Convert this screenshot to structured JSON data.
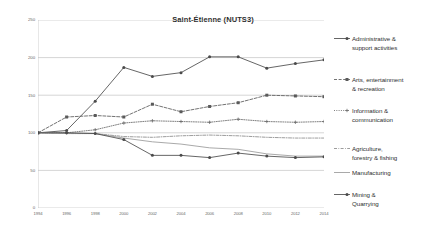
{
  "chart": {
    "title": "Saint-Étienne (NUTS3)"
  },
  "axes": {
    "y_tick_labels": [
      "250",
      "200",
      "150",
      "100",
      "50",
      "0"
    ],
    "x_tick_labels": [
      "1994",
      "1996",
      "1998",
      "2000",
      "2002",
      "2004",
      "2006",
      "2008",
      "2010",
      "2012",
      "2014"
    ]
  },
  "legend": {
    "items": [
      {
        "label": "Administrative &\nsupport activities",
        "color": "#4a4a4a",
        "dash": "solid",
        "marker": "circle"
      },
      {
        "label": "Arts, entertainment\n& recreation",
        "color": "#5a5a5a",
        "dash": "dashed",
        "marker": "square"
      },
      {
        "label": "Information &\ncommunication",
        "color": "#6a6a6a",
        "dash": "dotted",
        "marker": "plus"
      },
      {
        "label": "Agriculture,\nforestry & fishing",
        "color": "#8a8a8a",
        "dash": "dashdot",
        "marker": "none"
      },
      {
        "label": "Manufacturing",
        "color": "#9a9a9a",
        "dash": "solid",
        "marker": "none"
      },
      {
        "label": "Mining &\nQuarrying",
        "color": "#4a4a4a",
        "dash": "solid",
        "marker": "circle"
      }
    ]
  },
  "chart_data": {
    "type": "line",
    "title": "Saint-Étienne (NUTS3)",
    "xlabel": "",
    "ylabel": "",
    "x": [
      1994,
      1996,
      1998,
      2000,
      2002,
      2004,
      2006,
      2008,
      2010,
      2012,
      2014
    ],
    "xlim": [
      1994,
      2014
    ],
    "ylim": [
      0,
      250
    ],
    "yticks": [
      0,
      50,
      100,
      150,
      200,
      250
    ],
    "grid": true,
    "legend_position": "right",
    "series": [
      {
        "name": "Administrative & support activities",
        "color": "#4a4a4a",
        "dash": "solid",
        "marker": "circle",
        "values": [
          100,
          103,
          142,
          187,
          175,
          180,
          201,
          201,
          186,
          192,
          197
        ]
      },
      {
        "name": "Arts, entertainment & recreation",
        "color": "#5a5a5a",
        "dash": "dashed",
        "marker": "square",
        "values": [
          100,
          121,
          123,
          121,
          138,
          128,
          135,
          140,
          150,
          149,
          148
        ]
      },
      {
        "name": "Information & communication",
        "color": "#6a6a6a",
        "dash": "dotted",
        "marker": "plus",
        "values": [
          100,
          100,
          104,
          113,
          116,
          115,
          114,
          118,
          115,
          114,
          115
        ]
      },
      {
        "name": "Agriculture, forestry & fishing",
        "color": "#8a8a8a",
        "dash": "dashdot",
        "marker": "none",
        "values": [
          100,
          99,
          99,
          95,
          94,
          96,
          97,
          96,
          94,
          93,
          93
        ]
      },
      {
        "name": "Manufacturing",
        "color": "#9a9a9a",
        "dash": "solid",
        "marker": "none",
        "values": [
          100,
          99,
          99,
          93,
          88,
          85,
          80,
          78,
          72,
          69,
          69
        ]
      },
      {
        "name": "Mining & Quarrying",
        "color": "#4a4a4a",
        "dash": "solid",
        "marker": "circle",
        "values": [
          100,
          100,
          99,
          91,
          70,
          70,
          67,
          73,
          69,
          67,
          68
        ]
      }
    ]
  }
}
